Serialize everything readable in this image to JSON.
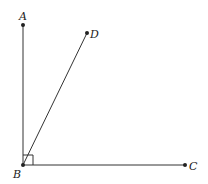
{
  "diagram": {
    "title": "",
    "points": [
      {
        "id": "A",
        "label": "A",
        "x": 23,
        "y": 25
      },
      {
        "id": "D",
        "label": "D",
        "x": 87,
        "y": 33
      },
      {
        "id": "B",
        "label": "B",
        "x": 23,
        "y": 165
      },
      {
        "id": "C",
        "label": "C",
        "x": 185,
        "y": 165
      }
    ],
    "segments": [
      {
        "from": "B",
        "to": "A"
      },
      {
        "from": "B",
        "to": "D"
      },
      {
        "from": "B",
        "to": "C"
      }
    ],
    "right_angle_at": "B",
    "labels": {
      "A": "A",
      "B": "B",
      "C": "C",
      "D": "D"
    }
  }
}
